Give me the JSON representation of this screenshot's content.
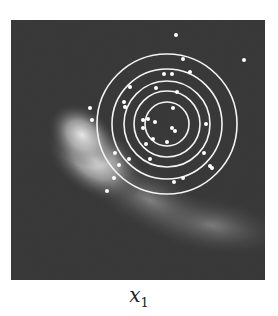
{
  "chart_data": {
    "type": "scatter",
    "title": "",
    "xlabel": "x1",
    "xlabel_main": "x",
    "xlabel_sub": "1",
    "ylabel": "",
    "grid": false,
    "legend": null,
    "background": {
      "description": "dark gray heatmap of a curved (banana-shaped) density, brightest at left-center, sweeping toward lower right",
      "frame_color": "#3a3a3a",
      "glow_color": "#f2f2f2"
    },
    "contours": {
      "type": "concentric circles",
      "color": "#f4f4f4",
      "center_px": [
        167,
        124
      ],
      "radii_px": [
        22,
        33,
        43,
        55,
        70
      ]
    },
    "points_px": [
      [
        176,
        35
      ],
      [
        183,
        59
      ],
      [
        244,
        60
      ],
      [
        164,
        74
      ],
      [
        172,
        74
      ],
      [
        190,
        72
      ],
      [
        130,
        87
      ],
      [
        156,
        88
      ],
      [
        177,
        92
      ],
      [
        124,
        102
      ],
      [
        125,
        107
      ],
      [
        90,
        108
      ],
      [
        92,
        120
      ],
      [
        173,
        108
      ],
      [
        143,
        120
      ],
      [
        148,
        119
      ],
      [
        155,
        122
      ],
      [
        143,
        128
      ],
      [
        172,
        128
      ],
      [
        175,
        131
      ],
      [
        206,
        124
      ],
      [
        153,
        139
      ],
      [
        146,
        144
      ],
      [
        167,
        142
      ],
      [
        204,
        153
      ],
      [
        115,
        153
      ],
      [
        129,
        159
      ],
      [
        150,
        159
      ],
      [
        210,
        166
      ],
      [
        212,
        168
      ],
      [
        119,
        165
      ],
      [
        114,
        178
      ],
      [
        174,
        182
      ],
      [
        183,
        178
      ],
      [
        107,
        191
      ]
    ],
    "point_color": "#ffffff"
  }
}
